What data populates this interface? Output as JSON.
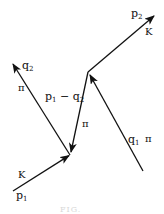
{
  "diagram": {
    "type": "feynman-like momentum diagram",
    "line_color": "#111111",
    "vertices": [
      {
        "id": "lower",
        "x": 70,
        "y": 155
      },
      {
        "id": "upper",
        "x": 88,
        "y": 72
      }
    ],
    "lines": [
      {
        "id": "p1",
        "particle": "K",
        "momentum_base": "p",
        "momentum_sub": "1",
        "from": [
          13,
          191
        ],
        "to": [
          70,
          155
        ],
        "arrow": "end"
      },
      {
        "id": "q2",
        "particle": "π",
        "momentum_base": "q",
        "momentum_sub": "2",
        "from": [
          70,
          155
        ],
        "to": [
          13,
          64
        ],
        "arrow": "end"
      },
      {
        "id": "internal",
        "particle": "π",
        "momentum": "p1 − q2",
        "from": [
          88,
          72
        ],
        "to": [
          70,
          155
        ],
        "arrow": "end"
      },
      {
        "id": "q1",
        "particle": "π",
        "momentum_base": "q",
        "momentum_sub": "1",
        "from": [
          143,
          171
        ],
        "to": [
          88,
          72
        ],
        "arrow": "end"
      },
      {
        "id": "p2",
        "particle": "K",
        "momentum_base": "p",
        "momentum_sub": "2",
        "from": [
          88,
          72
        ],
        "to": [
          153,
          17
        ],
        "arrow": "end"
      }
    ]
  },
  "labels": {
    "p2": {
      "base": "p",
      "sub": "2"
    },
    "K_top": "K",
    "q2": {
      "base": "q",
      "sub": "2"
    },
    "pi_q2": "π",
    "internal": {
      "p": "p",
      "p_sub": "1",
      "minus": " − ",
      "q": "q",
      "q_sub": "2"
    },
    "pi_internal": "π",
    "q1": {
      "base": "q",
      "sub": "1"
    },
    "pi_q1": "π",
    "K_bottom": "K",
    "p1": {
      "base": "p",
      "sub": "1"
    }
  },
  "caption": "FIG."
}
